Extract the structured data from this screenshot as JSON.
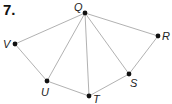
{
  "problem": {
    "number": "7."
  },
  "diagram": {
    "colors": {
      "edge": "#a8a8a8",
      "vertex": "#111111",
      "label": "#222222"
    },
    "vertices": [
      {
        "id": "Q",
        "label": "Q",
        "x": 85,
        "y": 13,
        "label_x": 74,
        "label_y": 11
      },
      {
        "id": "R",
        "label": "R",
        "x": 158,
        "y": 36,
        "label_x": 162,
        "label_y": 40
      },
      {
        "id": "S",
        "label": "S",
        "x": 129,
        "y": 74,
        "label_x": 130,
        "label_y": 87
      },
      {
        "id": "T",
        "label": "T",
        "x": 89,
        "y": 96,
        "label_x": 93,
        "label_y": 103
      },
      {
        "id": "U",
        "label": "U",
        "x": 47,
        "y": 81,
        "label_x": 41,
        "label_y": 96
      },
      {
        "id": "V",
        "label": "V",
        "x": 15,
        "y": 44,
        "label_x": 3,
        "label_y": 48
      }
    ],
    "edges": [
      [
        "Q",
        "V"
      ],
      [
        "Q",
        "U"
      ],
      [
        "Q",
        "T"
      ],
      [
        "Q",
        "S"
      ],
      [
        "Q",
        "R"
      ],
      [
        "V",
        "U"
      ],
      [
        "U",
        "T"
      ],
      [
        "T",
        "S"
      ],
      [
        "S",
        "R"
      ]
    ]
  }
}
